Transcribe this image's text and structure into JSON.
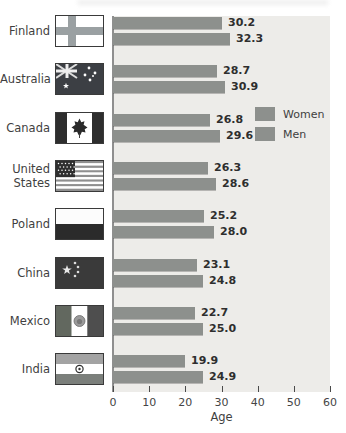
{
  "chart_data": {
    "type": "bar",
    "orientation": "horizontal",
    "categories": [
      "Finland",
      "Australia",
      "Canada",
      "United States",
      "Poland",
      "China",
      "Mexico",
      "India"
    ],
    "series": [
      {
        "name": "Women",
        "values": [
          30.2,
          28.7,
          26.8,
          26.3,
          25.2,
          23.1,
          22.7,
          19.9
        ]
      },
      {
        "name": "Men",
        "values": [
          32.3,
          30.9,
          29.6,
          28.6,
          28.0,
          24.8,
          25.0,
          24.9
        ]
      }
    ],
    "flags": [
      "finland",
      "australia",
      "canada",
      "united-states",
      "poland",
      "china",
      "mexico",
      "india"
    ],
    "xlabel": "Age",
    "xlim": [
      0,
      60
    ],
    "xticks": [
      0,
      10,
      20,
      30,
      40,
      50,
      60
    ],
    "grid": false,
    "legend_position": "upper-right",
    "value_labels": "one-decimal",
    "colors": {
      "bar": "#8d908d",
      "plot_background": "#edece9",
      "axis": "#8f8f8f",
      "value_text": "#2e2e2e",
      "label_text": "#3f3f3f"
    }
  }
}
